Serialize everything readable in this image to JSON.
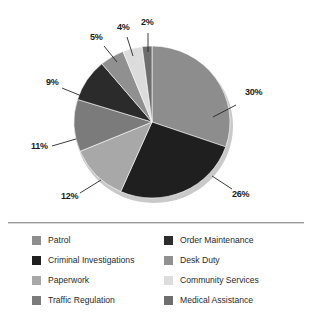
{
  "chart_data": {
    "type": "pie",
    "title": "",
    "subtitle": "",
    "xlabel": "",
    "ylabel": "",
    "legend_position": "bottom",
    "grid": false,
    "categories": [
      "Patrol",
      "Criminal Investigations",
      "Order Maintenance",
      "Traffic Regulation",
      "Paperwork",
      "Desk Duty",
      "Community Services",
      "Medical Assistance"
    ],
    "values": [
      30,
      26,
      9,
      11,
      12,
      5,
      4,
      2
    ],
    "units": "percent",
    "slices": [
      {
        "label": "Patrol",
        "value": 30,
        "display": "30%",
        "color": "#8d8d8d",
        "order": 1
      },
      {
        "label": "Criminal Investigations",
        "value": 26,
        "display": "26%",
        "color": "#1f1f1f",
        "order": 2
      },
      {
        "label": "Paperwork",
        "value": 12,
        "display": "12%",
        "color": "#a8a8a8",
        "order": 3
      },
      {
        "label": "Traffic Regulation",
        "value": 11,
        "display": "11%",
        "color": "#7b7b7b",
        "order": 4
      },
      {
        "label": "Order Maintenance",
        "value": 9,
        "display": "9%",
        "color": "#2b2b2b",
        "order": 5
      },
      {
        "label": "Desk Duty",
        "value": 5,
        "display": "5%",
        "color": "#909090",
        "order": 6
      },
      {
        "label": "Community Services",
        "value": 4,
        "display": "4%",
        "color": "#dcdcdc",
        "order": 7
      },
      {
        "label": "Medical Assistance",
        "value": 2,
        "display": "2%",
        "color": "#6e6e6e",
        "order": 8
      }
    ]
  },
  "labels": {
    "p30": "30%",
    "p26": "26%",
    "p12": "12%",
    "p11": "11%",
    "p9": "9%",
    "p5": "5%",
    "p4": "4%",
    "p2": "2%"
  },
  "legend": {
    "column_left": [
      {
        "label": "Patrol",
        "color": "#8d8d8d",
        "swatch_name": "swatch-patrol"
      },
      {
        "label": "Criminal Investigations",
        "color": "#1f1f1f",
        "swatch_name": "swatch-criminal-investigations"
      },
      {
        "label": "Paperwork",
        "color": "#a8a8a8",
        "swatch_name": "swatch-paperwork"
      },
      {
        "label": "Traffic Regulation",
        "color": "#7b7b7b",
        "swatch_name": "swatch-traffic-regulation"
      }
    ],
    "column_right": [
      {
        "label": "Order Maintenance",
        "color": "#2b2b2b",
        "swatch_name": "swatch-order-maintenance"
      },
      {
        "label": "Desk Duty",
        "color": "#909090",
        "swatch_name": "swatch-desk-duty"
      },
      {
        "label": "Community Services",
        "color": "#dcdcdc",
        "swatch_name": "swatch-community-services"
      },
      {
        "label": "Medical Assistance",
        "color": "#6e6e6e",
        "swatch_name": "swatch-medical-assistance"
      }
    ]
  },
  "colors": {
    "background": "#ffffff",
    "divider": "#9a9a9a",
    "label_text": "#1b1b1b",
    "legend_text": "#2a2a2a",
    "leader_line": "#262626",
    "pie_shadow": "#c9c9c9"
  }
}
